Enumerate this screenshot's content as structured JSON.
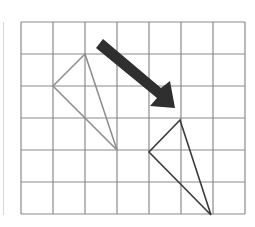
{
  "diagram": {
    "type": "grid-translation",
    "grid": {
      "columns": 7,
      "rows": 6,
      "origin_x": 21,
      "origin_y": 22,
      "cell_size": 32,
      "line_color": "#8a8a8a"
    },
    "shapes": [
      {
        "name": "original-triangle",
        "points": "85,54 53,86 117,150",
        "stroke": "#8c8c8c",
        "stroke_width": 1.5
      },
      {
        "name": "translated-triangle",
        "points": "180,120 149,152 211,215",
        "stroke": "#3a3a3a",
        "stroke_width": 1.6
      }
    ],
    "arrow": {
      "points": "103,39 161,88 170,81 175,108 150,106 157,98 96,48",
      "fill": "#2f2f2f"
    }
  }
}
